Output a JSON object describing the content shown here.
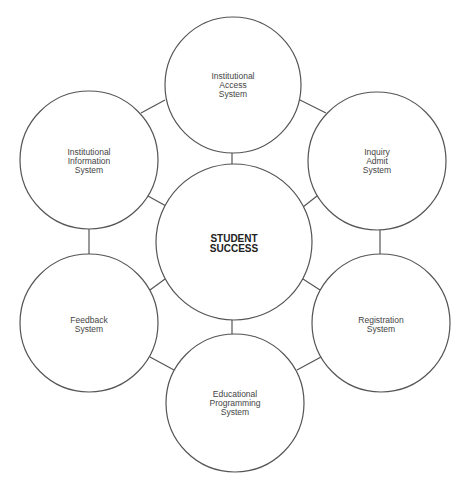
{
  "diagram": {
    "center": {
      "lines": [
        "STUDENT",
        "SUCCESS"
      ]
    },
    "nodes": [
      {
        "id": "institutional-access",
        "lines": [
          "Institutional",
          "Access",
          "System"
        ]
      },
      {
        "id": "inquiry-admit",
        "lines": [
          "Inquiry",
          "Admit",
          "System"
        ]
      },
      {
        "id": "registration",
        "lines": [
          "Registration",
          "System"
        ]
      },
      {
        "id": "educational-programming",
        "lines": [
          "Educational",
          "Programming",
          "System"
        ]
      },
      {
        "id": "feedback",
        "lines": [
          "Feedback",
          "System"
        ]
      },
      {
        "id": "institutional-information",
        "lines": [
          "Institutional",
          "Information",
          "System"
        ]
      }
    ],
    "colors": {
      "stroke": "#555555",
      "text": "#444444",
      "background": "#ffffff"
    }
  }
}
